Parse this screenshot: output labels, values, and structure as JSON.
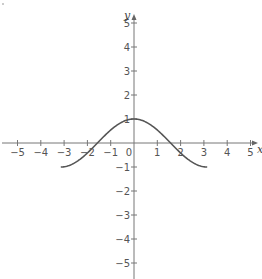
{
  "chart_data": {
    "type": "line",
    "title": "",
    "xlabel": "x",
    "ylabel": "y",
    "xlim": [
      -5,
      5
    ],
    "ylim": [
      -5,
      5
    ],
    "grid": false,
    "legend": null,
    "x_ticks": [
      -5,
      -4,
      -3,
      -2,
      -1,
      0,
      1,
      2,
      3,
      4,
      5
    ],
    "x_tick_labels": [
      "−5",
      "−4",
      "−3",
      "−2",
      "−1",
      "0",
      "1",
      "2",
      "3",
      "4",
      "5"
    ],
    "y_ticks": [
      -5,
      -4,
      -3,
      -2,
      -1,
      1,
      2,
      3,
      4,
      5
    ],
    "y_tick_labels": [
      "−5",
      "−4",
      "−3",
      "−2",
      "−1",
      "1",
      "2",
      "3",
      "4",
      "5"
    ],
    "series": [
      {
        "name": "y = cos(x)",
        "function": "cos(x)",
        "domain": [
          -3.1416,
          3.1416
        ],
        "x": [
          -3.1416,
          -2.5,
          -2,
          -1.5708,
          -1,
          -0.5,
          0,
          0.5,
          1,
          1.5708,
          2,
          2.5,
          3.1416
        ],
        "y": [
          -1,
          -0.801,
          -0.416,
          0,
          0.54,
          0.878,
          1,
          0.878,
          0.54,
          0,
          -0.416,
          -0.801,
          -1
        ],
        "color": "#555555"
      }
    ]
  },
  "layout": {
    "origin_px": [
      134,
      143
    ],
    "unit_px_x": 23.3,
    "unit_px_y": 24,
    "x_axis_extent_px": [
      2,
      258
    ],
    "y_axis_extent_px": [
      14,
      279
    ]
  }
}
